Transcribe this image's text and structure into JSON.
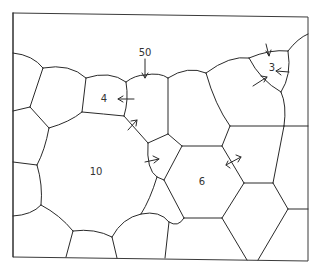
{
  "diagram": {
    "labels": [
      {
        "id": "grain-10",
        "text": "10",
        "x": 96,
        "y": 171
      },
      {
        "id": "grain-6",
        "text": "6",
        "x": 202,
        "y": 181
      },
      {
        "id": "grain-4",
        "text": "4",
        "x": 104,
        "y": 98
      },
      {
        "id": "grain-3",
        "text": "3",
        "x": 272,
        "y": 67
      },
      {
        "id": "label-50",
        "text": "50",
        "x": 145,
        "y": 52
      }
    ],
    "colors": {
      "line": "#2a2a2a",
      "frame": "#3a3a3a",
      "background": "#ffffff"
    }
  }
}
